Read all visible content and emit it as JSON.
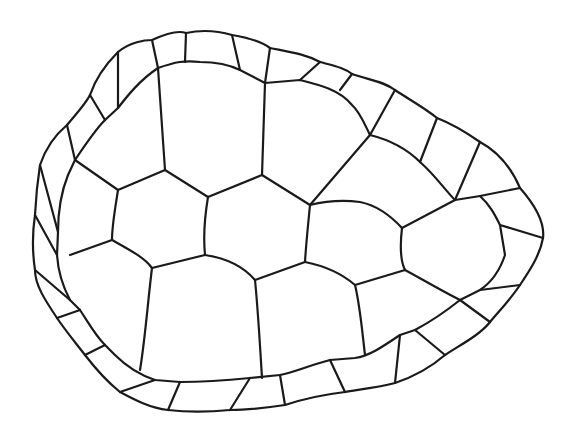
{
  "figure": {
    "background": "#ffffff",
    "stroke_color": "#1a1a1a",
    "stroke_width": 2.2,
    "outer_outline": "M118,52 C130,42 145,40 152,40 C165,34 178,30 186,33 C200,30 215,30 232,35 C250,38 262,42 270,48 C290,52 305,54 320,62 C335,66 345,68 352,74 C370,80 385,82 395,90 C410,100 425,108 437,118 C455,125 470,135 480,142 C495,150 510,165 520,188 C535,205 545,222 543,238 C540,255 530,270 520,285 C510,300 500,310 490,322 C480,335 460,345 445,355 C430,368 410,378 395,383 C375,388 355,390 345,392 C320,395 300,400 285,405 C265,408 245,410 230,410 C210,412 185,412 168,410 C150,408 135,400 120,392 C105,380 95,368 85,355 C75,342 65,330 57,318 C45,300 35,285 35,270 C32,250 32,235 35,215 C36,195 38,178 40,165 C45,150 55,135 67,125 C75,115 85,105 90,95 C95,80 105,65 118,52 Z",
    "inner_outline": "M158,68 C175,62 185,60 200,62 C215,62 230,65 240,70 L265,83 L300,80 C320,85 340,90 352,105 C360,112 365,125 370,135 C390,140 408,150 420,162 C435,175 445,190 455,200 L480,196 C490,205 495,215 500,225 L505,255 C500,270 492,282 480,290 L460,300 C445,312 430,322 415,330 L400,335 C385,345 370,356 355,358 L330,360 C310,365 295,372 280,375 L250,378 C230,380 205,382 180,382 L155,380 C140,375 125,365 115,355 L105,345 C95,335 88,322 80,310 L70,300 C62,285 58,270 57,255 L58,232 C58,210 62,190 68,175 L75,160 C85,145 95,130 105,120 L118,108 C128,95 140,80 158,68 Z",
    "marginal_dividers": [
      "M152,40 L158,68",
      "M186,33 L185,62",
      "M232,35 L240,70",
      "M270,48 L265,83",
      "M320,62 L300,80",
      "M352,74 L340,90",
      "M395,90 L370,135",
      "M437,118 L420,162",
      "M480,142 L455,200",
      "M520,188 L480,196",
      "M543,238 L500,225",
      "M520,285 L480,290",
      "M490,322 L460,300",
      "M445,355 L415,330",
      "M395,383 L400,335",
      "M345,392 L330,360",
      "M285,405 L280,375",
      "M230,410 L250,378",
      "M168,410 L180,382",
      "M120,392 L155,380",
      "M85,355 L105,345",
      "M57,318 L80,310",
      "M35,270 L70,300",
      "M35,215 L57,255",
      "M40,165 L58,232",
      "M67,125 L75,160",
      "M90,95 L105,120",
      "M118,52 L118,108"
    ],
    "vertebral_costal_dividers": [
      "M158,68 L165,170",
      "M265,83 L262,175",
      "M370,135 L310,205",
      "M75,160 L118,190",
      "M165,170 L118,190",
      "M165,170 L208,197",
      "M262,175 L208,197",
      "M262,175 L310,205",
      "M310,205 C330,200 345,200 360,202 C375,205 390,215 402,228",
      "M455,200 L402,228",
      "M118,190 C115,210 112,225 112,240",
      "M208,197 C205,215 203,235 205,255",
      "M310,205 C308,225 306,245 305,262",
      "M402,228 C400,245 400,260 405,270",
      "M112,240 L70,255",
      "M112,240 C130,250 145,258 152,268",
      "M205,255 L152,268",
      "M205,255 C225,258 242,265 255,280",
      "M305,262 L255,280",
      "M305,262 C320,265 340,272 355,285",
      "M405,270 L355,285",
      "M405,270 C420,278 440,290 460,300",
      "M152,268 C148,300 145,340 140,370",
      "M255,280 C258,310 260,345 262,378",
      "M355,285 C360,305 362,330 365,355"
    ]
  }
}
